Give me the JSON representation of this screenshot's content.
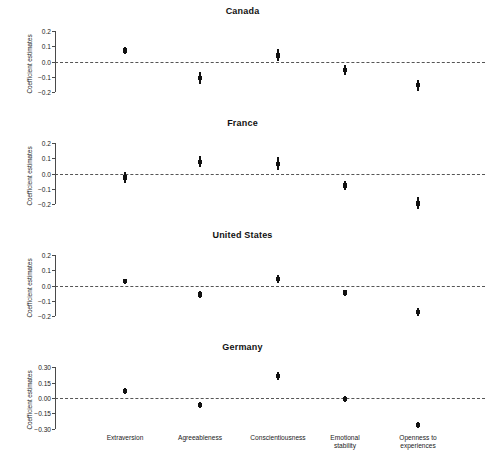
{
  "chart_data": {
    "type": "scatter",
    "title": "",
    "xlabel": "",
    "ylabel": "Coefficient estimates",
    "grid": false,
    "legend": null,
    "categories": [
      "Extraversion",
      "Agreeableness",
      "Conscientiousness",
      "Emotional stability",
      "Openness to experiences"
    ],
    "category_labels_multiline": [
      "Extraversion",
      "Agreeableness",
      "Conscientiousness",
      "Emotional\nstability",
      "Openness to\nexperiences"
    ],
    "reference_line": 0.0,
    "panels": [
      {
        "title": "Canada",
        "ylim": [
          -0.25,
          0.22
        ],
        "yticks": [
          0.2,
          0.1,
          0.0,
          -0.1,
          -0.2
        ],
        "ytick_labels": [
          "0.2",
          "0.1",
          "0.0",
          "−0.1",
          "−0.2"
        ],
        "values": [
          0.073,
          -0.105,
          0.04,
          -0.053,
          -0.153
        ],
        "ci_low": [
          0.05,
          -0.148,
          0.003,
          -0.085,
          -0.19
        ],
        "ci_high": [
          0.098,
          -0.068,
          0.08,
          -0.02,
          -0.118
        ]
      },
      {
        "title": "France",
        "ylim": [
          -0.25,
          0.22
        ],
        "yticks": [
          0.2,
          0.1,
          0.0,
          -0.1,
          -0.2
        ],
        "ytick_labels": [
          "0.2",
          "0.1",
          "0.0",
          "−0.1",
          "−0.2"
        ],
        "values": [
          -0.025,
          0.078,
          0.065,
          -0.078,
          -0.195
        ],
        "ci_low": [
          -0.062,
          0.043,
          0.025,
          -0.105,
          -0.232
        ],
        "ci_high": [
          0.012,
          0.115,
          0.108,
          -0.05,
          -0.155
        ]
      },
      {
        "title": "United States",
        "ylim": [
          -0.25,
          0.22
        ],
        "yticks": [
          0.2,
          0.1,
          0.0,
          -0.1,
          -0.2
        ],
        "ytick_labels": [
          "0.2",
          "0.1",
          "0.0",
          "−0.1",
          "−0.2"
        ],
        "values": [
          0.03,
          -0.058,
          0.043,
          -0.045,
          -0.17
        ],
        "ci_low": [
          0.012,
          -0.08,
          0.018,
          -0.065,
          -0.195
        ],
        "ci_high": [
          0.046,
          -0.036,
          0.072,
          -0.026,
          -0.145
        ]
      },
      {
        "title": "Germany",
        "ylim": [
          -0.37,
          0.33
        ],
        "yticks": [
          0.3,
          0.15,
          0.0,
          -0.15,
          -0.3
        ],
        "ytick_labels": [
          "0.30",
          "0.15",
          "0.00",
          "−0.15",
          "−0.30"
        ],
        "values": [
          0.068,
          -0.068,
          0.212,
          -0.01,
          -0.262
        ],
        "ci_low": [
          0.04,
          -0.1,
          0.172,
          -0.04,
          -0.292
        ],
        "ci_high": [
          0.098,
          -0.038,
          0.252,
          0.02,
          -0.232
        ]
      }
    ],
    "colors": {
      "marker": "#111111",
      "axis": "#4a4a4a",
      "reference_line": "#555555",
      "text": "#1a1a1a"
    }
  }
}
